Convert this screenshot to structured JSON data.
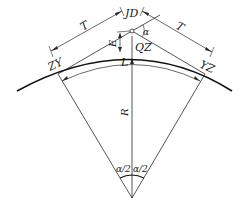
{
  "diagram": {
    "type": "circular-curve-geometry",
    "colors": {
      "line": "#2a2a2a",
      "curve": "#111111",
      "background": "#ffffff"
    },
    "labels": {
      "intersection_point": "JD",
      "mid_curve_point": "QZ",
      "curve_start": "ZY",
      "curve_end": "YZ",
      "tangent_left": "T",
      "tangent_right": "T",
      "external_distance": "E",
      "curve_length": "L",
      "radius": "R",
      "deflection_angle": "α",
      "half_angle_left": "α/2",
      "half_angle_right": "α/2"
    }
  }
}
